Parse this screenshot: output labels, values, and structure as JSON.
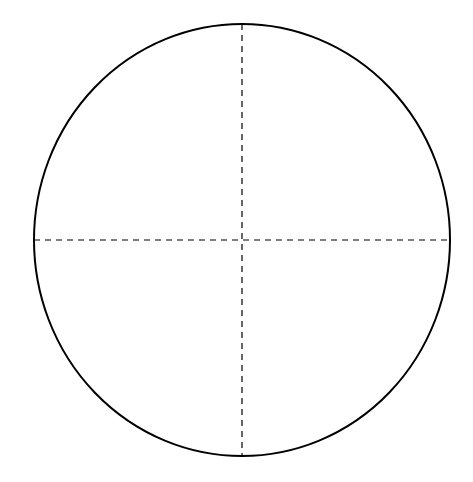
{
  "diagram": {
    "type": "circle-with-crosshairs",
    "background": "#ffffff",
    "stroke_color": "#000000",
    "circle": {
      "cx": 242,
      "cy": 240,
      "rx": 208,
      "ry": 216,
      "stroke_width": 2
    },
    "crosshair": {
      "style": "dashed",
      "dash": "6,5",
      "stroke_width": 1.2
    }
  }
}
